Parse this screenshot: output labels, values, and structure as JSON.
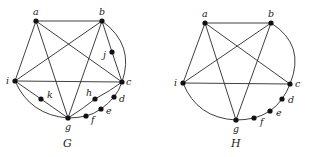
{
  "graphs": [
    {
      "id": "G",
      "caption": "G",
      "nodes": [
        {
          "id": "a",
          "label": "a",
          "x": 36,
          "y": 21
        },
        {
          "id": "b",
          "label": "b",
          "x": 102,
          "y": 21
        },
        {
          "id": "j",
          "label": "j",
          "x": 112,
          "y": 52
        },
        {
          "id": "i",
          "label": "i",
          "x": 15,
          "y": 81
        },
        {
          "id": "c",
          "label": "c",
          "x": 122,
          "y": 82
        },
        {
          "id": "k",
          "label": "k",
          "x": 41,
          "y": 99
        },
        {
          "id": "h",
          "label": "h",
          "x": 95,
          "y": 99
        },
        {
          "id": "d",
          "label": "d",
          "x": 114,
          "y": 97
        },
        {
          "id": "e",
          "label": "e",
          "x": 101,
          "y": 109
        },
        {
          "id": "f",
          "label": "f",
          "x": 86,
          "y": 116
        },
        {
          "id": "g",
          "label": "g",
          "x": 68,
          "y": 118
        }
      ],
      "edges": [
        [
          "a",
          "b"
        ],
        [
          "a",
          "i"
        ],
        [
          "a",
          "g"
        ],
        [
          "a",
          "c"
        ],
        [
          "b",
          "i"
        ],
        [
          "b",
          "g"
        ],
        [
          "b",
          "j"
        ],
        [
          "j",
          "c"
        ],
        [
          "b",
          "c"
        ],
        [
          "i",
          "c"
        ],
        [
          "i",
          "k"
        ],
        [
          "k",
          "g"
        ],
        [
          "i",
          "g"
        ],
        [
          "g",
          "h"
        ],
        [
          "h",
          "c"
        ],
        [
          "c",
          "d"
        ],
        [
          "d",
          "e"
        ],
        [
          "e",
          "f"
        ],
        [
          "f",
          "g"
        ]
      ]
    },
    {
      "id": "H",
      "caption": "H",
      "nodes": [
        {
          "id": "a",
          "label": "a",
          "x": 205,
          "y": 23
        },
        {
          "id": "b",
          "label": "b",
          "x": 271,
          "y": 23
        },
        {
          "id": "i",
          "label": "i",
          "x": 183,
          "y": 83
        },
        {
          "id": "c",
          "label": "c",
          "x": 290,
          "y": 84
        },
        {
          "id": "d",
          "label": "d",
          "x": 282,
          "y": 99
        },
        {
          "id": "e",
          "label": "e",
          "x": 270,
          "y": 111
        },
        {
          "id": "f",
          "label": "f",
          "x": 254,
          "y": 118
        },
        {
          "id": "g",
          "label": "g",
          "x": 236,
          "y": 120
        }
      ],
      "edges": [
        [
          "a",
          "b"
        ],
        [
          "a",
          "i"
        ],
        [
          "a",
          "g"
        ],
        [
          "a",
          "c"
        ],
        [
          "b",
          "i"
        ],
        [
          "b",
          "g"
        ],
        [
          "b",
          "c"
        ],
        [
          "i",
          "c"
        ],
        [
          "i",
          "g"
        ],
        [
          "c",
          "d"
        ],
        [
          "d",
          "e"
        ],
        [
          "e",
          "f"
        ],
        [
          "f",
          "g"
        ]
      ]
    }
  ]
}
